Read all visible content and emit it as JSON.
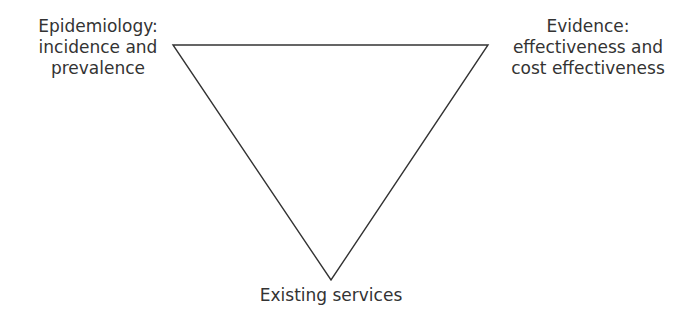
{
  "diagram": {
    "type": "inverted-triangle",
    "line_color": "#333333",
    "vertices": {
      "top_left": {
        "lines": [
          "Epidemiology:",
          "incidence and",
          "prevalence"
        ]
      },
      "top_right": {
        "lines": [
          "Evidence:",
          "effectiveness and",
          "cost effectiveness"
        ]
      },
      "bottom": {
        "lines": [
          "Existing services"
        ]
      }
    }
  }
}
